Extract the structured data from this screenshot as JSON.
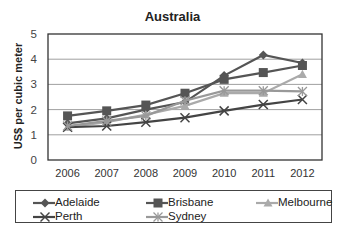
{
  "chart_data": {
    "type": "line",
    "title": "Australia",
    "xlabel": "",
    "ylabel": "US$ per cubic meter",
    "categories": [
      "2006",
      "2007",
      "2008",
      "2009",
      "2010",
      "2011",
      "2012"
    ],
    "ylim": [
      0,
      5
    ],
    "yticks": [
      0,
      1,
      2,
      3,
      4,
      5
    ],
    "grid": true,
    "legend_position": "bottom",
    "series": [
      {
        "name": "Adelaide",
        "marker": "diamond",
        "color": "#555555",
        "values": [
          1.45,
          1.65,
          2.0,
          2.3,
          3.35,
          4.17,
          3.85
        ]
      },
      {
        "name": "Brisbane",
        "marker": "square",
        "color": "#555555",
        "values": [
          1.75,
          1.95,
          2.18,
          2.65,
          3.2,
          3.47,
          3.75
        ]
      },
      {
        "name": "Melbourne",
        "marker": "triangle",
        "color": "#aaaaaa",
        "values": [
          1.3,
          1.5,
          1.8,
          2.15,
          2.65,
          2.65,
          3.4
        ]
      },
      {
        "name": "Perth",
        "marker": "x",
        "color": "#444444",
        "values": [
          1.3,
          1.35,
          1.5,
          1.68,
          1.95,
          2.2,
          2.4
        ]
      },
      {
        "name": "Sydney",
        "marker": "asterisk",
        "color": "#999999",
        "values": [
          1.35,
          1.55,
          1.75,
          2.35,
          2.75,
          2.75,
          2.72
        ]
      }
    ]
  }
}
